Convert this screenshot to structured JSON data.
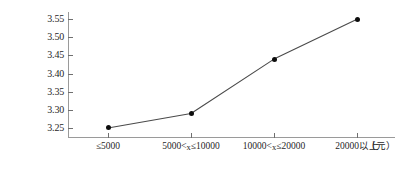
{
  "chart_data": {
    "type": "line",
    "title": "",
    "xlabel": "",
    "ylabel": "",
    "unit_label": "（元）",
    "categories": [
      "≤5000",
      "5000<x≤10000",
      "10000<x≤20000",
      "20000以上"
    ],
    "values": [
      3.25,
      3.29,
      3.44,
      3.55
    ],
    "ylim": [
      3.225,
      3.57
    ],
    "yticks": [
      "3.25",
      "3.30",
      "3.35",
      "3.40",
      "3.45",
      "3.50",
      "3.55"
    ],
    "ytick_values": [
      3.25,
      3.3,
      3.35,
      3.4,
      3.45,
      3.5,
      3.55
    ],
    "grid": false,
    "legend": "none",
    "line_color": "#4a4a4a",
    "marker_color": "#0d0d0d",
    "axis_color": "#9a9a9a"
  }
}
